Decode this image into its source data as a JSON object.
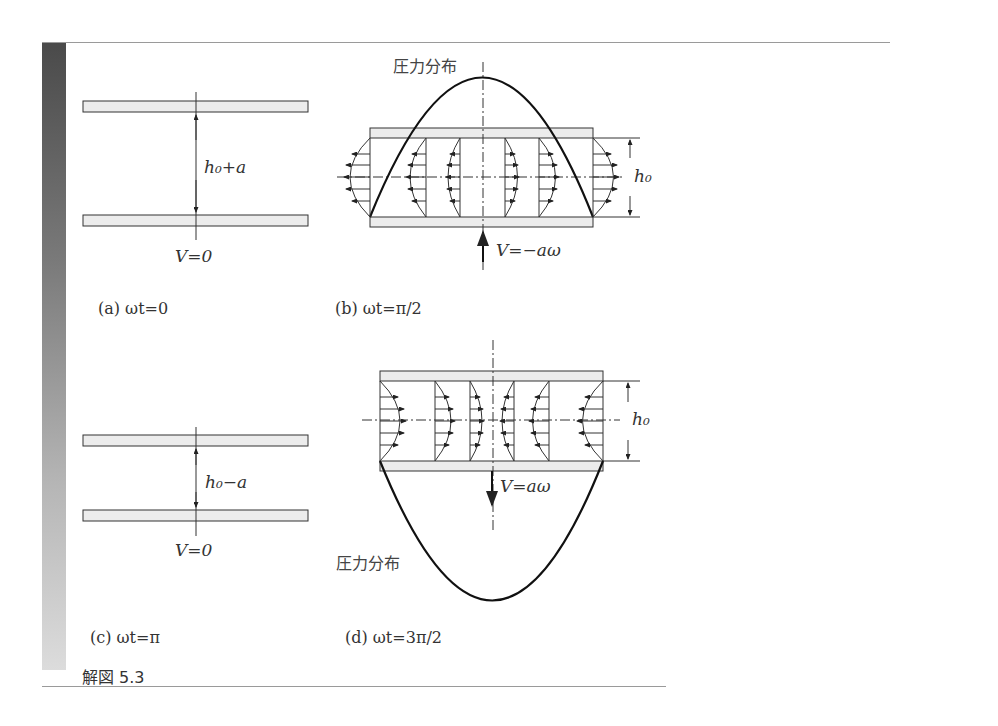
{
  "figure": {
    "title": "解図 5.3",
    "panels": [
      {
        "id": "a",
        "caption": "(a)  ωt=0",
        "gap_label": "h₀+a",
        "velocity_label": "V=0"
      },
      {
        "id": "b",
        "caption": "(b)  ωt=π/2",
        "pressure_label": "圧力分布",
        "height_label": "h₀",
        "velocity_label": "V=−aω"
      },
      {
        "id": "c",
        "caption": "(c)  ωt=π",
        "gap_label": "h₀−a",
        "velocity_label": "V=0"
      },
      {
        "id": "d",
        "caption": "(d)  ωt=3π/2",
        "pressure_label": "圧力分布",
        "height_label": "h₀",
        "velocity_label": "V=aω"
      }
    ]
  },
  "colors": {
    "line": "#222222",
    "plate_fill": "#ececec",
    "text": "#333333"
  }
}
